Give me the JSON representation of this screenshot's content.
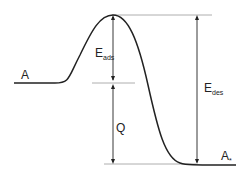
{
  "diagram": {
    "type": "potential-energy-curve",
    "labels": {
      "initial_state": "A",
      "final_state_main": "A",
      "final_state_sub": "*",
      "e_ads_main": "E",
      "e_ads_sub": "ads",
      "e_des_main": "E",
      "e_des_sub": "des",
      "q": "Q"
    },
    "colors": {
      "line": "#222222",
      "guide": "#999999"
    }
  }
}
